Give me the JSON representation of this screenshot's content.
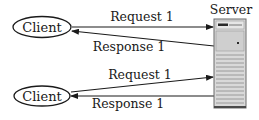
{
  "diagram": {
    "type": "client-server request/response",
    "server": {
      "label": "Server",
      "icon": "server-tower-icon"
    },
    "clients": [
      {
        "label": "Client",
        "request_label": "Request 1",
        "response_label": "Response 1"
      },
      {
        "label": "Client",
        "request_label": "Request 1",
        "response_label": "Response 1"
      }
    ],
    "colors": {
      "line": "#1a1a1a",
      "server_body": "#d9d9d9",
      "server_panel": "#c8c8c8",
      "server_stripe": "#8a8a8a",
      "background": "#ffffff"
    }
  }
}
